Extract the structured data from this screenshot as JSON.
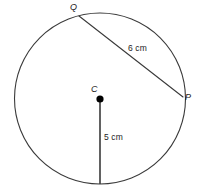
{
  "figure": {
    "kind": "circle-geometry-diagram",
    "background_color": "#ffffff",
    "stroke_color": "#3a3a3a",
    "text_color": "#1d1d1d",
    "width": 201,
    "height": 192
  },
  "circle": {
    "center_x": 100,
    "center_y": 98.5,
    "radius": 85.5,
    "stroke_width": 1.1
  },
  "points": {
    "center": {
      "label": "C",
      "x": 100,
      "y": 99,
      "dot_radius": 3.6,
      "dot_color": "#000000"
    },
    "q": {
      "label": "Q",
      "x": 79,
      "y": 16
    },
    "p": {
      "label": "P",
      "x": 183,
      "y": 97
    }
  },
  "segments": {
    "chord": {
      "name": "chord-QP",
      "length_label": "6 cm",
      "from_x": 79,
      "from_y": 16,
      "to_x": 183,
      "to_y": 97,
      "stroke_width": 1.1
    },
    "radius": {
      "name": "radius-C-bottom",
      "length_label": "5 cm",
      "from_x": 100,
      "from_y": 99,
      "to_x": 100,
      "to_y": 184,
      "stroke_width": 1.6
    }
  }
}
